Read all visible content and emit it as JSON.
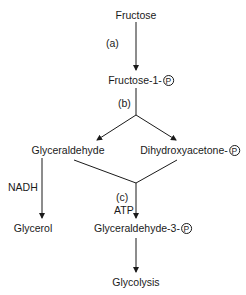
{
  "diagram": {
    "nodes": {
      "fructose": "Fructose",
      "fructose_1_p": "Fructose-1-",
      "glyceraldehyde": "Glyceraldehyde",
      "dihydroxyacetone_p": "Dihydroxyacetone-",
      "glycerol": "Glycerol",
      "glyceraldehyde_3_p": "Glyceraldehyde-3-",
      "glycolysis": "Glycolysis"
    },
    "phosphate_symbol": "P",
    "step_labels": {
      "a": "(a)",
      "b": "(b)",
      "c": "(c)"
    },
    "cofactors": {
      "nadh": "NADH",
      "atp": "ATP"
    },
    "edges": [
      {
        "from": "Fructose",
        "to": "Fructose-1-P",
        "label": "(a)"
      },
      {
        "from": "Fructose-1-P",
        "to": "Glyceraldehyde",
        "label": "(b)"
      },
      {
        "from": "Fructose-1-P",
        "to": "Dihydroxyacetone-P",
        "label": "(b)"
      },
      {
        "from": "Glyceraldehyde",
        "to": "Glycerol",
        "label": "NADH"
      },
      {
        "from": "Glyceraldehyde",
        "to": "Glyceraldehyde-3-P",
        "label": "(c) ATP"
      },
      {
        "from": "Dihydroxyacetone-P",
        "to": "Glyceraldehyde-3-P",
        "label": ""
      },
      {
        "from": "Glyceraldehyde-3-P",
        "to": "Glycolysis",
        "label": ""
      }
    ],
    "colors": {
      "line": "#1a1a1a",
      "text": "#1a1a1a",
      "background": "#ffffff"
    }
  }
}
